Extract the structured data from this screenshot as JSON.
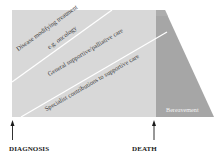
{
  "diagram": {
    "type": "care-continuum",
    "colors": {
      "care_area": "#d8d8d8",
      "bereavement_area": "#a6a6a6",
      "divider": "#ffffff",
      "arrow": "#1a1a1a"
    },
    "bands": [
      {
        "label": "Disease modifying treatment",
        "sublabel": "e.g. oncology"
      },
      {
        "label": "General supportive/palliative care"
      },
      {
        "label": "Specialist contributions to supportive care"
      }
    ],
    "bereavement": {
      "label": "Bereavement"
    },
    "markers": [
      {
        "label": "DIAGNOSIS"
      },
      {
        "label": "DEATH"
      }
    ]
  }
}
